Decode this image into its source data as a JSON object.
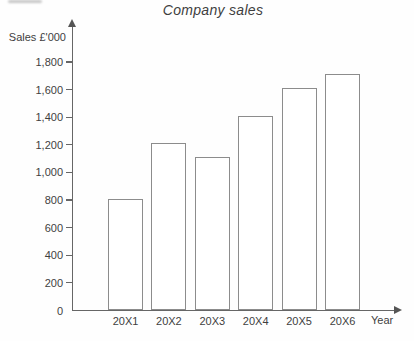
{
  "chart_data": {
    "type": "bar",
    "title": "Company sales",
    "ylabel": "Sales £'000",
    "xlabel": "Year",
    "categories": [
      "20X1",
      "20X2",
      "20X3",
      "20X4",
      "20X5",
      "20X6"
    ],
    "values": [
      810,
      1210,
      1110,
      1410,
      1610,
      1710
    ],
    "ylim": [
      0,
      1800
    ],
    "yticks": [
      0,
      200,
      400,
      600,
      800,
      1000,
      1200,
      1400,
      1600,
      1800
    ],
    "ytick_labels": [
      "0",
      "200",
      "400",
      "600",
      "800",
      "1,000",
      "1,200",
      "1,400",
      "1,600",
      "1,800"
    ],
    "grid": false,
    "legend": null,
    "bar_fill": "#ffffff",
    "bar_outline": "#8c8c8c",
    "axis_color": "#666666",
    "text_color": "#3f3f3f",
    "background": "#fefefe"
  }
}
